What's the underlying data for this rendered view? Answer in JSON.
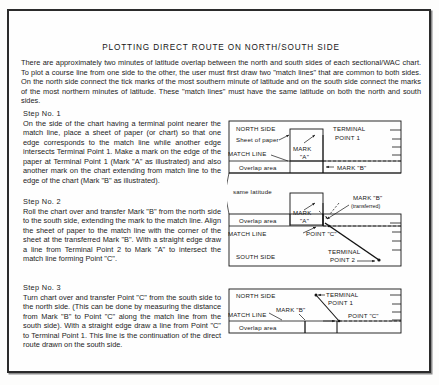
{
  "page": {
    "title": "PLOTTING DIRECT ROUTE ON NORTH/SOUTH SIDE",
    "intro": "There are approximately two minutes of latitude overlap between the north and south sides of each sectional/WAC chart. To plot a course line from one side to the other, the user must first draw two \"match lines\" that are common to both sides. On the north side connect the tick marks of the most southern minute of latitude and on the south side connect the marks of the most northern minutes of latitude. These \"match lines\" must have the same latitude on both the north and south sides."
  },
  "steps": [
    {
      "heading": "Step No. 1",
      "body": "On the side of the chart having a terminal point nearer the match line, place a sheet of paper (or chart) so that one edge corresponds to the match line while another edge intersects Terminal Point 1. Make a mark on the edge of the paper at Terminal Point 1 (Mark \"A\" as illustrated) and also another mark on the chart extending from match line to the edge of the chart (Mark \"B\" as illustrated)."
    },
    {
      "heading": "Step No. 2",
      "body": "Roll the chart over and transfer Mark \"B\" from the north side to the south side, extending the mark to the match line. Align the sheet of paper to the match line with the corner of the sheet at the transferred Mark \"B\". With a straight edge draw a line from Terminal Point 2 to Mark \"A\" to intersect the match line forming Point \"C\"."
    },
    {
      "heading": "Step No. 3",
      "body": "Turn chart over and transfer Point \"C\" from the south side to the north side. (This can be done by measuring the distance from Mark \"B\" to Point \"C\" along the match line from the south side). With a straight edge draw a line from Point \"C\" to Terminal Point 1. This line is the continuation of the direct route drawn on the south side."
    }
  ],
  "diagrams": {
    "connector_label": "same latitude",
    "panel1": {
      "name": "step1-diagram",
      "north_side": "NORTH SIDE",
      "sheet_of_paper": "Sheet of paper",
      "match_line": "MATCH LINE",
      "overlap_area": "Overlap area",
      "mark_a_line1": "MARK",
      "mark_a_line2": "\"A\"",
      "terminal_line1": "TERMINAL",
      "terminal_line2": "POINT 1",
      "mark_b": "MARK \"B\""
    },
    "panel2": {
      "name": "step2-diagram",
      "overlap_area": "Overlap area",
      "match_line": "MATCH LINE",
      "south_side": "SOUTH SIDE",
      "mark_a_line1": "MARK",
      "mark_a_line2": "\"A\"",
      "point_c": "POINT \"C\"",
      "mark_b_line1": "MARK \"B\"",
      "mark_b_line2": "(transferred)",
      "terminal_line1": "TERMINAL",
      "terminal_line2": "POINT 2"
    },
    "panel3": {
      "name": "step3-diagram",
      "north_side": "NORTH SIDE",
      "match_line": "MATCH LINE",
      "overlap_area": "Overlap area",
      "mark_b": "MARK \"B\"",
      "point_c": "POINT \"C\"",
      "terminal_line1": "TERMINAL",
      "terminal_line2": "POINT 1"
    }
  },
  "colors": {
    "frame": "#2b2b2b",
    "ink": "#141414",
    "paper": "#fefefe"
  }
}
